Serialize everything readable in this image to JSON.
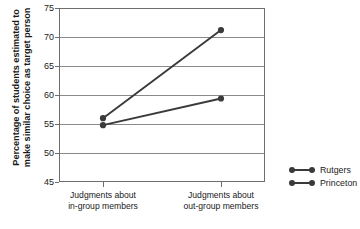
{
  "chart_data": {
    "type": "line",
    "title": "",
    "xlabel": "",
    "ylabel": "Percentage of students estimated to make similar choice as target person",
    "ylabel_lines": [
      "Percentage of students estimated to",
      "make similar choice as target person"
    ],
    "categories": [
      "Judgments about in-group members",
      "Judgments about out-group members"
    ],
    "category_lines": [
      [
        "Judgments about",
        "in-group members"
      ],
      [
        "Judgments about",
        "out-group members"
      ]
    ],
    "ylim": [
      45,
      75
    ],
    "yticks": [
      75,
      70,
      65,
      60,
      55,
      50,
      45
    ],
    "grid": true,
    "legend_position": "right",
    "series": [
      {
        "name": "Rutgers",
        "values": [
          56.0,
          71.2
        ],
        "color": "#3a3a3a"
      },
      {
        "name": "Princeton",
        "values": [
          54.8,
          59.4
        ],
        "color": "#3a3a3a"
      }
    ]
  },
  "legend": {
    "items": [
      {
        "label": "Rutgers"
      },
      {
        "label": "Princeton"
      }
    ]
  },
  "axis": {
    "y_tick_labels": [
      "75",
      "70",
      "65",
      "60",
      "55",
      "50",
      "45"
    ]
  }
}
